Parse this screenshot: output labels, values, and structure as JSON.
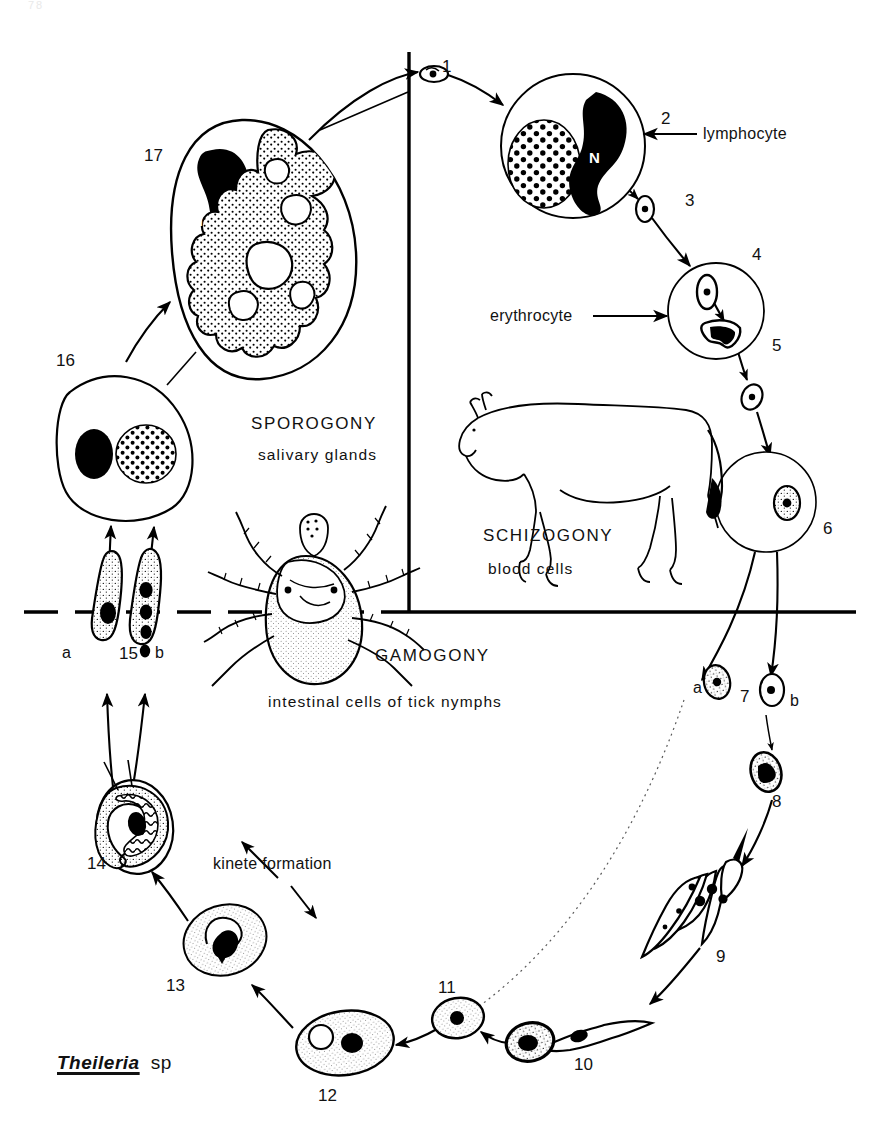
{
  "figure": {
    "species_label": {
      "genus": "Theileria",
      "sp": "sp"
    },
    "page_header": {
      "folio": "78",
      "left_title": "",
      "right_title": ""
    },
    "sections": [
      {
        "id": "sporogony",
        "title": "SPOROGONY",
        "subtitle": "salivary glands"
      },
      {
        "id": "schizogony",
        "title": "SCHIZOGONY",
        "subtitle": "blood cells"
      },
      {
        "id": "gamogony",
        "title": "GAMOGONY",
        "subtitle": "intestinal cells of tick nymphs"
      }
    ],
    "annotations": [
      {
        "id": "lymphocyte",
        "text": "lymphocyte"
      },
      {
        "id": "erythrocyte",
        "text": "erythrocyte"
      },
      {
        "id": "kinete-formation",
        "text": "kinete formation"
      }
    ],
    "nucleus_labels": [
      {
        "id": "n-stage-2",
        "text": "N"
      },
      {
        "id": "n-stage-17",
        "text": "N"
      }
    ],
    "stage_numbers": [
      {
        "id": "stage-1",
        "text": "1"
      },
      {
        "id": "stage-2",
        "text": "2"
      },
      {
        "id": "stage-3",
        "text": "3"
      },
      {
        "id": "stage-4",
        "text": "4"
      },
      {
        "id": "stage-5",
        "text": "5"
      },
      {
        "id": "stage-6",
        "text": "6"
      },
      {
        "id": "stage-7",
        "text": "7"
      },
      {
        "id": "stage-8",
        "text": "8"
      },
      {
        "id": "stage-9",
        "text": "9"
      },
      {
        "id": "stage-10",
        "text": "10"
      },
      {
        "id": "stage-11",
        "text": "11"
      },
      {
        "id": "stage-12",
        "text": "12"
      },
      {
        "id": "stage-13",
        "text": "13"
      },
      {
        "id": "stage-14",
        "text": "14"
      },
      {
        "id": "stage-15",
        "text": "15"
      },
      {
        "id": "stage-16",
        "text": "16"
      },
      {
        "id": "stage-17",
        "text": "17"
      }
    ],
    "sub_labels": [
      {
        "id": "stage-7-a",
        "text": "a"
      },
      {
        "id": "stage-7-b",
        "text": "b"
      },
      {
        "id": "stage-15-a",
        "text": "a"
      },
      {
        "id": "stage-15-b",
        "text": "b"
      }
    ],
    "colors": {
      "ink": "#000000",
      "paper": "#ffffff",
      "nucleus_fill": "#000000",
      "stipple": "#000000"
    },
    "organism_drawings": [
      {
        "id": "cow-drawing",
        "name": "bovine host"
      },
      {
        "id": "tick-drawing",
        "name": "ixodid tick vector"
      }
    ]
  }
}
